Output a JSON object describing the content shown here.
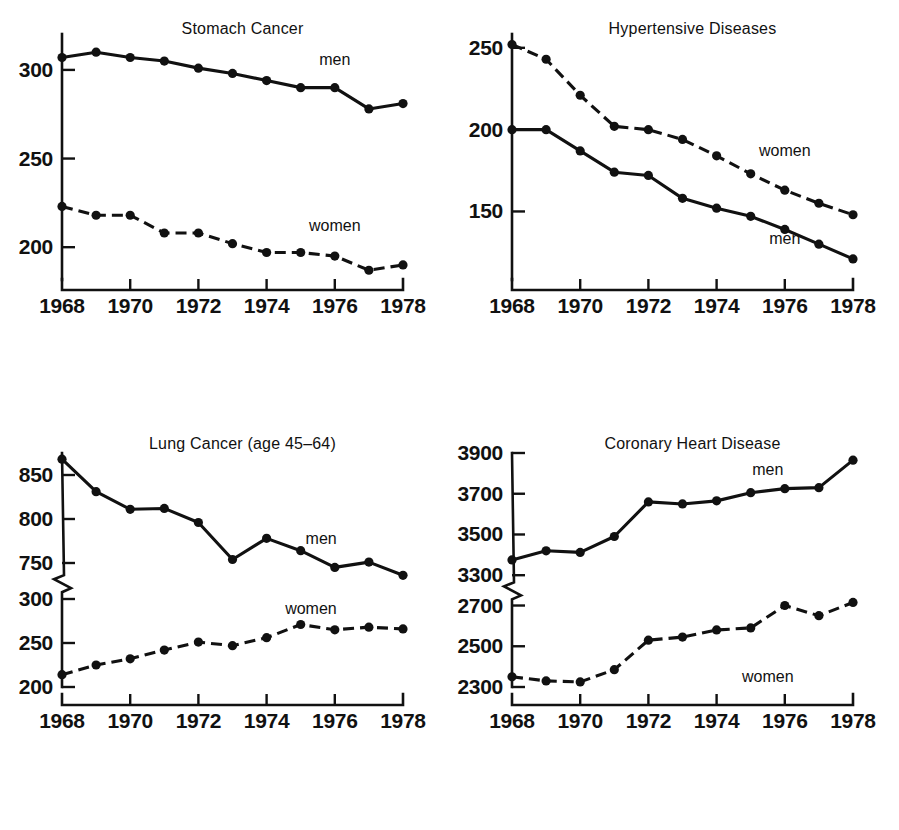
{
  "figure": {
    "background_color": "#ffffff",
    "ink_color": "#111111",
    "panel_count": 4,
    "series_names": [
      "men",
      "women"
    ],
    "x_tick_labels": [
      "1968",
      "1970",
      "1972",
      "1974",
      "1976",
      "1978"
    ]
  },
  "chart_data": [
    {
      "id": "stomach-cancer",
      "type": "line",
      "title": "Stomach Cancer",
      "xlabel": "",
      "ylabel": "",
      "grid": false,
      "legend_position": "inline-annotation",
      "x": [
        1968,
        1969,
        1970,
        1971,
        1972,
        1973,
        1974,
        1975,
        1976,
        1977,
        1978
      ],
      "xlim": [
        1968,
        1978
      ],
      "xticks": [
        1968,
        1970,
        1972,
        1974,
        1976,
        1978
      ],
      "xticklabels": [
        "1968",
        "1970",
        "1972",
        "1974",
        "1976",
        "1978"
      ],
      "ylim": [
        186,
        318
      ],
      "yticks": [
        200,
        250,
        300
      ],
      "yticklabels": [
        "200",
        "250",
        "300"
      ],
      "axis_break": null,
      "series": [
        {
          "name": "men",
          "style": "solid",
          "label_x": 1976,
          "label_y": 303,
          "values": [
            307,
            310,
            307,
            305,
            301,
            298,
            294,
            290,
            290,
            278,
            281
          ]
        },
        {
          "name": "women",
          "style": "dashed",
          "label_x": 1976,
          "label_y": 209,
          "values": [
            223,
            218,
            218,
            208,
            208,
            202,
            197,
            197,
            195,
            187,
            190
          ]
        }
      ]
    },
    {
      "id": "hypertensive-diseases",
      "type": "line",
      "title": "Hypertensive Diseases",
      "xlabel": "",
      "ylabel": "",
      "grid": false,
      "legend_position": "inline-annotation",
      "x": [
        1968,
        1969,
        1970,
        1971,
        1972,
        1973,
        1974,
        1975,
        1976,
        1977,
        1978
      ],
      "xlim": [
        1968,
        1978
      ],
      "xticks": [
        1968,
        1970,
        1972,
        1974,
        1976,
        1978
      ],
      "xticklabels": [
        "1968",
        "1970",
        "1972",
        "1974",
        "1976",
        "1978"
      ],
      "ylim": [
        113,
        256
      ],
      "yticks": [
        150,
        200,
        250
      ],
      "yticklabels": [
        "150",
        "200",
        "250"
      ],
      "axis_break": null,
      "series": [
        {
          "name": "women",
          "style": "dashed",
          "label_x": 1976,
          "label_y": 184,
          "values": [
            252,
            243,
            221,
            202,
            200,
            194,
            184,
            173,
            163,
            155,
            148
          ]
        },
        {
          "name": "men",
          "style": "solid",
          "label_x": 1976,
          "label_y": 130,
          "values": [
            200,
            200,
            187,
            174,
            172,
            158,
            152,
            147,
            139,
            130,
            121
          ]
        }
      ]
    },
    {
      "id": "lung-cancer-45-64",
      "type": "line",
      "title": "Lung Cancer (age 45–64)",
      "xlabel": "",
      "ylabel": "",
      "grid": false,
      "legend_position": "inline-annotation",
      "x": [
        1968,
        1969,
        1970,
        1971,
        1972,
        1973,
        1974,
        1975,
        1976,
        1977,
        1978
      ],
      "xlim": [
        1968,
        1978
      ],
      "xticks": [
        1968,
        1970,
        1972,
        1974,
        1976,
        1978
      ],
      "xticklabels": [
        "1968",
        "1970",
        "1972",
        "1974",
        "1976",
        "1978"
      ],
      "ylim": [
        200,
        875
      ],
      "yticks": [
        200,
        250,
        300,
        750,
        800,
        850
      ],
      "yticklabels": [
        "200",
        "250",
        "300",
        "750",
        "800",
        "850"
      ],
      "axis_break": {
        "lower": 310,
        "upper": 735
      },
      "series": [
        {
          "name": "men",
          "style": "solid",
          "label_x": 1975.6,
          "label_y": 772,
          "values": [
            868,
            831,
            811,
            812,
            796,
            754,
            778,
            764,
            745,
            751,
            736
          ]
        },
        {
          "name": "women",
          "style": "dashed",
          "label_x": 1975.3,
          "label_y": 283,
          "values": [
            214,
            225,
            232,
            242,
            251,
            247,
            256,
            271,
            265,
            268,
            266
          ]
        }
      ]
    },
    {
      "id": "coronary-heart-disease",
      "type": "line",
      "title": "Coronary Heart Disease",
      "xlabel": "",
      "ylabel": "",
      "grid": false,
      "legend_position": "inline-annotation",
      "x": [
        1968,
        1969,
        1970,
        1971,
        1972,
        1973,
        1974,
        1975,
        1976,
        1977,
        1978
      ],
      "xlim": [
        1968,
        1978
      ],
      "xticks": [
        1968,
        1970,
        1972,
        1974,
        1976,
        1978
      ],
      "xticklabels": [
        "1968",
        "1970",
        "1972",
        "1974",
        "1976",
        "1978"
      ],
      "ylim": [
        2300,
        3900
      ],
      "yticks": [
        2300,
        2500,
        2700,
        3300,
        3500,
        3700,
        3900
      ],
      "yticklabels": [
        "2300",
        "2500",
        "2700",
        "3300",
        "3500",
        "3700",
        "3900"
      ],
      "axis_break": {
        "lower": 2740,
        "upper": 3260
      },
      "series": [
        {
          "name": "men",
          "style": "solid",
          "label_x": 1975.5,
          "label_y": 3790,
          "values": [
            3375,
            3420,
            3412,
            3490,
            3660,
            3650,
            3665,
            3705,
            3725,
            3730,
            3865
          ]
        },
        {
          "name": "women",
          "style": "dashed",
          "label_x": 1975.5,
          "label_y": 2775,
          "values": [
            2350,
            2330,
            2325,
            2385,
            2530,
            2545,
            2580,
            2590,
            2700,
            2650,
            2715
          ]
        }
      ]
    }
  ]
}
